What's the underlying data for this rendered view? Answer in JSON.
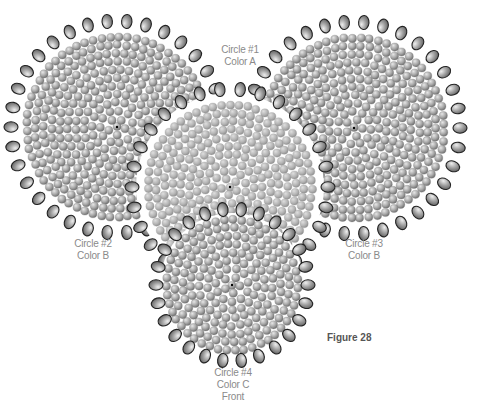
{
  "figure": {
    "title": "Figure 28",
    "colors": {
      "background": "#ffffff",
      "label_text": "#8a8a8a",
      "figure_text": "#555555",
      "bead_fill_light": "#d6d6d6",
      "bead_fill_mid": "#a8a8a8",
      "bead_fill_dark": "#6e6e6e",
      "edge_bead_outline": "#2a2a2a",
      "circle1_fill": "#b8b8b8"
    }
  },
  "circles": [
    {
      "id": "circle-2",
      "line1": "Circle #2",
      "line2": "Color B",
      "cx": 117,
      "cy": 127,
      "r": 100,
      "edge_count": 34,
      "z": 1
    },
    {
      "id": "circle-3",
      "line1": "Circle #3",
      "line2": "Color B",
      "cx": 354,
      "cy": 128,
      "r": 100,
      "edge_count": 34,
      "z": 1
    },
    {
      "id": "circle-1",
      "line1": "Circle #1",
      "line2": "Color A",
      "cx": 230,
      "cy": 187,
      "r": 92,
      "edge_count": 30,
      "z": 2
    },
    {
      "id": "circle-4",
      "line1": "Circle #4",
      "line2": "Color C",
      "line3": "Front",
      "cx": 232,
      "cy": 285,
      "r": 70,
      "edge_count": 26,
      "z": 3
    }
  ],
  "labels": {
    "circle1": {
      "line1": "Circle #1",
      "line2": "Color A"
    },
    "circle2": {
      "line1": "Circle #2",
      "line2": "Color B"
    },
    "circle3": {
      "line1": "Circle #3",
      "line2": "Color B"
    },
    "circle4": {
      "line1": "Circle #4",
      "line2": "Color C",
      "line3": "Front"
    }
  }
}
